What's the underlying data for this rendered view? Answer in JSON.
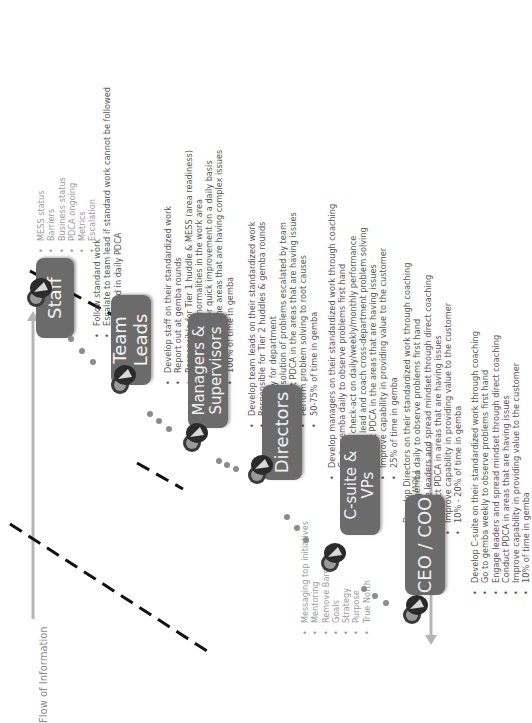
{
  "diagram": {
    "flow_top": {
      "label": "Flow of Information",
      "direction": "right"
    },
    "flow_bottom": {
      "label": "Flow of Information",
      "direction": "left",
      "upside_down": true
    },
    "colors": {
      "box": "#6b6b6b",
      "box_text": "#f2f2f2",
      "bullet_text": "#555555",
      "light_text": "#9a9a9a",
      "arrow": "#b5b5b5",
      "dashed_line": "#111111"
    },
    "roles": [
      {
        "id": "staff",
        "label": "Staff",
        "bullets": [
          "Follow standard work",
          "Escalate to team lead if standard work cannot be followed",
          "Engaged in daily PDCA"
        ]
      },
      {
        "id": "team-leads",
        "label": "Team Leads",
        "bullets": [
          "Develop staff on their standardized work",
          "Report out at gemba rounds",
          "Responsible for Tier 1 huddle & MESS (area readiness)",
          "Respond to abnormalities in the work area",
          "Active PDCA for quick improvement on a daily basis",
          "Write A3's in the areas that are having complex issues",
          "100% of time in gemba"
        ]
      },
      {
        "id": "managers-supervisors",
        "label": "Managers & Supervisors",
        "bullets": [
          "Develop team leads on their standardized work",
          "Responsible for Tier 2 huddles & gemba rounds",
          "Plan day for department",
          "Daily resolution of problems escalated by team",
          "Conduct PDCA in the areas that are having issues",
          "Perform problem solving to root causes",
          "50-75% of time in gemba"
        ]
      },
      {
        "id": "directors",
        "label": "Directors",
        "bullets": [
          "Develop managers on their standardized work through coaching",
          "Go to gemba  daily to observe problems first hand",
          "Perform check-act on daily/weekly/monthly performance",
          "Actively lead  and coach cross-department problem solving",
          "Conduct PDCA in the areas that are having issues",
          "Improve capability in providing value to the customer",
          "25% of time in gemba"
        ]
      },
      {
        "id": "c-suite-vps",
        "label": "C-suite & VPs",
        "bullets": [
          "Develop Directors on their standardized work through coaching",
          "Go to gemba  daily to observe problems first hand",
          "Engage leaders and spread mindset through direct coaching",
          "Conduct PDCA in areas that are having issues",
          "Improve capability in providing value to the customer",
          "10% - 20%  of time in gemba"
        ]
      },
      {
        "id": "ceo-coo",
        "label": "CEO / COO",
        "bullets": [
          "Develop C-suite on their standardized work through coaching",
          "Go to gemba weekly to observe problems first hand",
          "Engage leaders and spread mindset through direct coaching",
          "Conduct PDCA in areas that are having issues",
          "Improve capability in providing value to the customer",
          "10% of time in gemba"
        ]
      }
    ],
    "upward_items": [
      "MESS status",
      "Barriers",
      "Business status",
      "PDCA ongoing",
      "Metrics",
      "Escalation"
    ],
    "downward_items": [
      "Messaging top initiatives",
      "Mentoring",
      "Remove Barriers",
      "Goals",
      "Strategy",
      "Purpose",
      "True North"
    ]
  }
}
